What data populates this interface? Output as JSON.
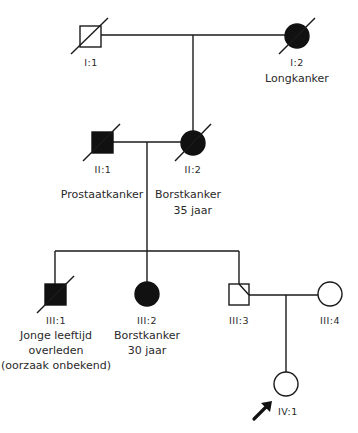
{
  "diagram": {
    "type": "pedigree",
    "colors": {
      "line": "#1a1a1a",
      "affected": "#111111",
      "unaffected": "#ffffff"
    },
    "generations": {
      "I": [
        {
          "id": "I:1",
          "sex": "male",
          "affected": false,
          "deceased": true,
          "labels": []
        },
        {
          "id": "I:2",
          "sex": "female",
          "affected": true,
          "deceased": true,
          "labels": [
            "Longkanker"
          ]
        }
      ],
      "II": [
        {
          "id": "II:1",
          "sex": "male",
          "affected": true,
          "deceased": true,
          "labels": [
            "Prostaatkanker"
          ]
        },
        {
          "id": "II:2",
          "sex": "female",
          "affected": true,
          "deceased": true,
          "labels": [
            "Borstkanker",
            "35 jaar"
          ]
        }
      ],
      "III": [
        {
          "id": "III:1",
          "sex": "male",
          "affected": true,
          "deceased": true,
          "labels": [
            "Jonge leeftijd",
            "overleden",
            "(oorzaak onbekend)"
          ]
        },
        {
          "id": "III:2",
          "sex": "female",
          "affected": true,
          "deceased": false,
          "labels": [
            "Borstkanker",
            "30 jaar"
          ]
        },
        {
          "id": "III:3",
          "sex": "male",
          "affected": false,
          "deceased": false,
          "labels": []
        },
        {
          "id": "III:4",
          "sex": "female",
          "affected": false,
          "deceased": false,
          "labels": []
        }
      ],
      "IV": [
        {
          "id": "IV:1",
          "sex": "female",
          "affected": false,
          "deceased": false,
          "proband": true,
          "labels": []
        }
      ]
    },
    "relationships": [
      {
        "type": "couple",
        "members": [
          "I:1",
          "I:2"
        ],
        "children": [
          "II:2"
        ]
      },
      {
        "type": "couple",
        "members": [
          "II:1",
          "II:2"
        ],
        "children": [
          "III:1",
          "III:2",
          "III:3"
        ]
      },
      {
        "type": "couple",
        "members": [
          "III:3",
          "III:4"
        ],
        "children": [
          "IV:1"
        ]
      }
    ],
    "proband_marker": "arrow-icon"
  }
}
